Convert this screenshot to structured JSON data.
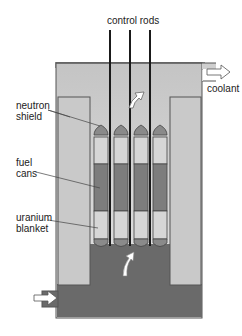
{
  "diagram": {
    "labels": {
      "control_rods": "control rods",
      "coolant": "coolant",
      "neutron_shield_1": "neutron",
      "neutron_shield_2": "shield",
      "fuel_cans_1": "fuel",
      "fuel_cans_2": "cans",
      "uranium_blanket_1": "uranium",
      "uranium_blanket_2": "blanket"
    },
    "components": [
      "control rods",
      "coolant",
      "neutron shield",
      "fuel cans",
      "uranium blanket"
    ],
    "fuel_can_count": 4,
    "control_rod_count": 3,
    "colors": {
      "vessel_light": "#dcdcdc",
      "shield": "#c8c8c8",
      "coolant_dark": "#6a6a6a",
      "fuel": "#7d7d7d",
      "blanket": "#d4d4d4",
      "outline": "#444444",
      "rod": "#1a1a1a",
      "arrow": "#ffffff"
    }
  }
}
